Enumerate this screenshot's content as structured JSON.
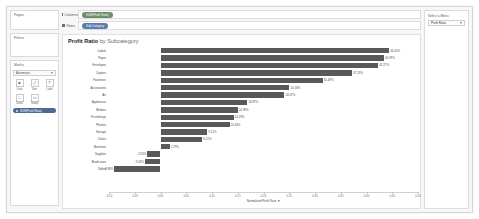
{
  "shelves": {
    "columns": {
      "label": "Columns",
      "pill": "SUM(Profit Ratio)"
    },
    "rows": {
      "label": "Rows",
      "pill": "Sub-Category"
    }
  },
  "left_panel": {
    "pages": {
      "title": "Pages"
    },
    "filters": {
      "title": "Filters"
    },
    "marks": {
      "title": "Marks",
      "type": "Automatic",
      "buttons": [
        {
          "name": "color",
          "label": "Color",
          "glyph": "■"
        },
        {
          "name": "size",
          "label": "Size",
          "glyph": "⤢"
        },
        {
          "name": "label",
          "label": "Label",
          "glyph": "T"
        },
        {
          "name": "detail",
          "label": "Detail",
          "glyph": "∴"
        },
        {
          "name": "tooltip",
          "label": "Tooltip",
          "glyph": "▭"
        }
      ],
      "pill": "SUM(Profit Ratio)"
    }
  },
  "right_panel": {
    "title": "Select a Metric",
    "selected": "Profit Ratio"
  },
  "viz": {
    "title_bold": "Profit Ratio",
    "title_rest": " by Subcategory"
  },
  "chart_data": {
    "type": "bar",
    "orientation": "horizontal",
    "title": "Profit Ratio by Subcategory",
    "xlabel": "Normalized Profit Ratio",
    "ylabel": "",
    "grid": false,
    "legend": null,
    "xlim": [
      -0.1,
      0.5
    ],
    "xticks": [
      -0.1,
      -0.05,
      0.0,
      0.05,
      0.1,
      0.15,
      0.2,
      0.25,
      0.3,
      0.35,
      0.4,
      0.45,
      0.5
    ],
    "xtick_labels": [
      "-0.10",
      "-0.05",
      "0.00",
      "0.05",
      "0.10",
      "0.15",
      "0.20",
      "0.25",
      "0.30",
      "0.35",
      "0.40",
      "0.45",
      "0.50"
    ],
    "bar_color": "#59595b",
    "categories": [
      "Labels",
      "Paper",
      "Envelopes",
      "Copiers",
      "Fasteners",
      "Accessories",
      "Art",
      "Appliances",
      "Binders",
      "Furnishings",
      "Phones",
      "Storage",
      "Chairs",
      "Machines",
      "Supplies",
      "Bookcases",
      "Tables"
    ],
    "values": [
      0.4442,
      0.4339,
      0.4227,
      0.3723,
      0.3149,
      0.2503,
      0.2407,
      0.1687,
      0.1499,
      0.1419,
      0.134,
      0.0912,
      0.0812,
      0.0179,
      -0.0255,
      -0.0302,
      -0.0898
    ],
    "labels": [
      "44.42%",
      "43.39%",
      "42.27%",
      "37.23%",
      "31.49%",
      "25.03%",
      "24.07%",
      "16.87%",
      "14.99%",
      "14.19%",
      "13.40%",
      "9.12%",
      "8.12%",
      "1.79%",
      "-2.55%",
      "-3.02%",
      "-8.98%"
    ]
  }
}
